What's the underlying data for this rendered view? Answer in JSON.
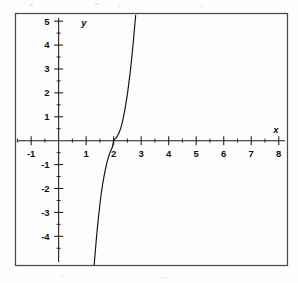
{
  "figure": {
    "name": "cubic-function-graph",
    "background_color": "#fdfdfd",
    "frame_color": "#4a4a4a",
    "ink_color": "#111111"
  },
  "chart_data": {
    "type": "line",
    "title": "",
    "subtitle": "",
    "xlabel": "x",
    "ylabel": "y",
    "xlim": [
      -1.55,
      8.3
    ],
    "ylim": [
      -5.2,
      5.3
    ],
    "grid": false,
    "legend": false,
    "legend_position": "none",
    "axis_style": "centered-cross",
    "x_ticks_major": [
      -1,
      1,
      2,
      3,
      4,
      5,
      6,
      7,
      8
    ],
    "x_ticks_major_labels": [
      "-1",
      "1",
      "2",
      "3",
      "4",
      "5",
      "6",
      "7",
      "8"
    ],
    "x_ticks_minor": [
      -1.5,
      -0.5,
      0.5,
      1.5,
      2.5,
      3.5,
      4.5,
      5.5,
      6.5,
      7.5
    ],
    "y_ticks_major": [
      -4,
      -3,
      -2,
      -1,
      1,
      2,
      3,
      4,
      5
    ],
    "y_ticks_major_labels": [
      "-4",
      "-3",
      "-2",
      "-1",
      "1",
      "2",
      "3",
      "4",
      "5"
    ],
    "y_ticks_minor": [
      -4.5,
      -3.5,
      -2.5,
      -1.5,
      -0.5,
      0.5,
      1.5,
      2.5,
      3.5,
      4.5
    ],
    "origin_label": "",
    "series": [
      {
        "name": "y = (x - 2)^3",
        "equation": "y = (x - 2)^3",
        "color": "#111111",
        "inflection_point": [
          2,
          0
        ],
        "x_intercept": 2,
        "y_intercept": -8,
        "x": [
          1.29,
          1.35,
          1.4,
          1.45,
          1.5,
          1.55,
          1.6,
          1.65,
          1.7,
          1.75,
          1.8,
          1.85,
          1.9,
          1.95,
          2.0,
          2.05,
          2.1,
          2.15,
          2.2,
          2.25,
          2.3,
          2.35,
          2.4,
          2.5,
          2.6,
          2.7,
          2.8,
          2.9,
          3.0,
          3.1,
          3.2,
          3.3,
          3.4,
          3.5,
          3.6,
          3.71
        ],
        "y": [
          -5.2,
          -4.39,
          -3.74,
          -3.17,
          -2.66,
          -2.21,
          -1.82,
          -1.49,
          -1.19,
          -0.94,
          -0.73,
          -0.55,
          -0.4,
          -0.28,
          0.0,
          0.08,
          0.13,
          0.23,
          0.34,
          0.5,
          0.7,
          0.95,
          1.25,
          1.95,
          2.85,
          3.96,
          5.25,
          6.72,
          8.4,
          10.3,
          12.44,
          14.83,
          17.5,
          20.45,
          23.71,
          27.8
        ],
        "visible_x_range": [
          1.29,
          3.71
        ],
        "note": "curve exits top of frame near x=3.71 and bottom of frame near x=1.29"
      }
    ]
  },
  "annotations": {
    "x_axis_label": "x",
    "y_axis_label": "y"
  }
}
